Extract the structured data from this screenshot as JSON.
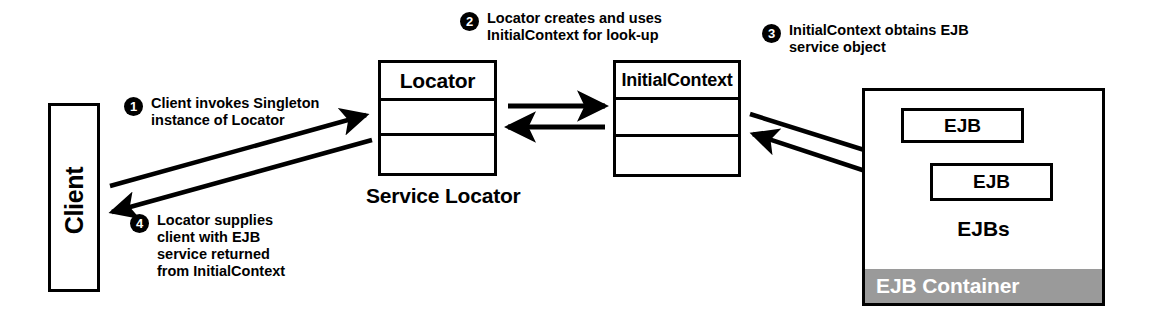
{
  "diagram": {
    "colors": {
      "stroke": "#000000",
      "background": "#ffffff",
      "container_band": "#9a9a9a",
      "band_text": "#ffffff"
    }
  },
  "client": {
    "label": "Client"
  },
  "locator": {
    "title": "Locator",
    "caption": "Service Locator",
    "compartments": [
      "Locator",
      "",
      ""
    ]
  },
  "initial_context": {
    "title": "InitialContext",
    "compartments": [
      "InitialContext",
      "",
      ""
    ]
  },
  "ejb_container": {
    "beans": [
      {
        "label": "EJB"
      },
      {
        "label": "EJB"
      }
    ],
    "group_label": "EJBs",
    "band_label": "EJB Container"
  },
  "steps": [
    {
      "number": "1",
      "text": "Client invokes Singleton\ninstance of Locator"
    },
    {
      "number": "2",
      "text": "Locator creates and uses\nInitialContext for look-up"
    },
    {
      "number": "3",
      "text": "InitialContext obtains EJB\nservice object"
    },
    {
      "number": "4",
      "text": "Locator supplies\nclient with EJB\nservice returned\nfrom InitialContext"
    }
  ],
  "connectors": [
    {
      "name": "client-to-locator",
      "direction": "right-up"
    },
    {
      "name": "locator-to-client",
      "direction": "left-down"
    },
    {
      "name": "locator-to-initialcontext",
      "direction": "right"
    },
    {
      "name": "initialcontext-to-locator",
      "direction": "left"
    },
    {
      "name": "initialcontext-to-ejb",
      "direction": "right-down"
    },
    {
      "name": "ejb-to-initialcontext",
      "direction": "left-up"
    }
  ]
}
